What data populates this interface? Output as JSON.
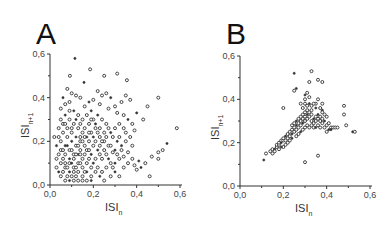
{
  "chart_data": [
    {
      "panel": "A",
      "type": "scatter",
      "title": "A",
      "xlabel": "ISI",
      "xlabel_sub": "n",
      "ylabel": "ISI",
      "ylabel_sub": "n+1",
      "xlim": [
        0,
        0.6
      ],
      "ylim": [
        0,
        0.6
      ],
      "xticks": [
        "0,0",
        "0,2",
        "0,4",
        "0,6"
      ],
      "yticks": [
        "0,0",
        "0,2",
        "0,4",
        "0,6"
      ],
      "grid": false,
      "points": [
        [
          0.115,
          0.58
        ],
        [
          0.185,
          0.53
        ],
        [
          0.25,
          0.5
        ],
        [
          0.31,
          0.51
        ],
        [
          0.355,
          0.48
        ],
        [
          0.157,
          0.47
        ],
        [
          0.092,
          0.5
        ],
        [
          0.5,
          0.4
        ],
        [
          0.45,
          0.36
        ],
        [
          0.585,
          0.26
        ],
        [
          0.54,
          0.19
        ],
        [
          0.52,
          0.16
        ],
        [
          0.5,
          0.15
        ],
        [
          0.47,
          0.13
        ],
        [
          0.44,
          0.1
        ],
        [
          0.42,
          0.08
        ],
        [
          0.4,
          0.07
        ],
        [
          0.46,
          0.04
        ],
        [
          0.5,
          0.12
        ],
        [
          0.43,
          0.3
        ],
        [
          0.4,
          0.33
        ],
        [
          0.37,
          0.39
        ],
        [
          0.35,
          0.41
        ],
        [
          0.33,
          0.38
        ],
        [
          0.3,
          0.36
        ],
        [
          0.28,
          0.4
        ],
        [
          0.26,
          0.42
        ],
        [
          0.24,
          0.41
        ],
        [
          0.22,
          0.43
        ],
        [
          0.2,
          0.39
        ],
        [
          0.18,
          0.38
        ],
        [
          0.14,
          0.4
        ],
        [
          0.12,
          0.41
        ],
        [
          0.1,
          0.42
        ],
        [
          0.08,
          0.44
        ],
        [
          0.06,
          0.4
        ],
        [
          0.05,
          0.35
        ],
        [
          0.07,
          0.37
        ],
        [
          0.09,
          0.38
        ],
        [
          0.16,
          0.36
        ],
        [
          0.19,
          0.34
        ],
        [
          0.23,
          0.37
        ],
        [
          0.27,
          0.35
        ],
        [
          0.31,
          0.33
        ],
        [
          0.34,
          0.32
        ],
        [
          0.36,
          0.3
        ],
        [
          0.38,
          0.28
        ],
        [
          0.39,
          0.25
        ],
        [
          0.37,
          0.22
        ],
        [
          0.35,
          0.2
        ],
        [
          0.33,
          0.18
        ],
        [
          0.38,
          0.18
        ],
        [
          0.36,
          0.15
        ],
        [
          0.34,
          0.13
        ],
        [
          0.32,
          0.12
        ],
        [
          0.3,
          0.1
        ],
        [
          0.38,
          0.12
        ],
        [
          0.36,
          0.1
        ],
        [
          0.34,
          0.08
        ],
        [
          0.39,
          0.09
        ],
        [
          0.41,
          0.11
        ],
        [
          0.29,
          0.15
        ],
        [
          0.27,
          0.18
        ],
        [
          0.25,
          0.2
        ],
        [
          0.23,
          0.22
        ],
        [
          0.28,
          0.24
        ],
        [
          0.3,
          0.26
        ],
        [
          0.32,
          0.28
        ],
        [
          0.26,
          0.28
        ],
        [
          0.24,
          0.3
        ],
        [
          0.22,
          0.32
        ],
        [
          0.2,
          0.3
        ],
        [
          0.18,
          0.28
        ],
        [
          0.21,
          0.26
        ],
        [
          0.19,
          0.24
        ],
        [
          0.17,
          0.22
        ],
        [
          0.15,
          0.24
        ],
        [
          0.13,
          0.26
        ],
        [
          0.11,
          0.28
        ],
        [
          0.09,
          0.3
        ],
        [
          0.07,
          0.32
        ],
        [
          0.05,
          0.3
        ],
        [
          0.04,
          0.26
        ],
        [
          0.06,
          0.24
        ],
        [
          0.08,
          0.22
        ],
        [
          0.1,
          0.2
        ],
        [
          0.12,
          0.18
        ],
        [
          0.14,
          0.16
        ],
        [
          0.16,
          0.14
        ],
        [
          0.18,
          0.12
        ],
        [
          0.2,
          0.1
        ],
        [
          0.22,
          0.08
        ],
        [
          0.24,
          0.06
        ],
        [
          0.26,
          0.08
        ],
        [
          0.28,
          0.1
        ],
        [
          0.3,
          0.06
        ],
        [
          0.32,
          0.04
        ],
        [
          0.28,
          0.04
        ],
        [
          0.24,
          0.12
        ],
        [
          0.26,
          0.14
        ],
        [
          0.22,
          0.16
        ],
        [
          0.2,
          0.18
        ],
        [
          0.18,
          0.2
        ],
        [
          0.16,
          0.18
        ],
        [
          0.14,
          0.2
        ],
        [
          0.12,
          0.22
        ],
        [
          0.1,
          0.24
        ],
        [
          0.08,
          0.26
        ],
        [
          0.06,
          0.28
        ],
        [
          0.04,
          0.22
        ],
        [
          0.03,
          0.18
        ],
        [
          0.04,
          0.14
        ],
        [
          0.05,
          0.1
        ],
        [
          0.06,
          0.06
        ],
        [
          0.07,
          0.02
        ],
        [
          0.09,
          0.02
        ],
        [
          0.11,
          0.02
        ],
        [
          0.13,
          0.02
        ],
        [
          0.15,
          0.02
        ],
        [
          0.17,
          0.02
        ],
        [
          0.19,
          0.02
        ],
        [
          0.05,
          0.04
        ],
        [
          0.07,
          0.08
        ],
        [
          0.09,
          0.1
        ],
        [
          0.11,
          0.12
        ],
        [
          0.13,
          0.14
        ],
        [
          0.15,
          0.12
        ],
        [
          0.17,
          0.1
        ],
        [
          0.19,
          0.08
        ],
        [
          0.21,
          0.06
        ],
        [
          0.23,
          0.04
        ],
        [
          0.25,
          0.02
        ],
        [
          0.03,
          0.08
        ],
        [
          0.03,
          0.12
        ],
        [
          0.05,
          0.16
        ],
        [
          0.07,
          0.18
        ],
        [
          0.09,
          0.16
        ],
        [
          0.11,
          0.14
        ],
        [
          0.13,
          0.1
        ],
        [
          0.15,
          0.08
        ],
        [
          0.17,
          0.06
        ],
        [
          0.19,
          0.04
        ],
        [
          0.21,
          0.12
        ],
        [
          0.23,
          0.14
        ],
        [
          0.25,
          0.16
        ],
        [
          0.27,
          0.12
        ],
        [
          0.29,
          0.08
        ],
        [
          0.31,
          0.14
        ],
        [
          0.33,
          0.16
        ],
        [
          0.35,
          0.24
        ],
        [
          0.31,
          0.2
        ],
        [
          0.29,
          0.22
        ],
        [
          0.27,
          0.26
        ],
        [
          0.25,
          0.24
        ],
        [
          0.23,
          0.26
        ],
        [
          0.21,
          0.28
        ],
        [
          0.19,
          0.3
        ],
        [
          0.17,
          0.32
        ],
        [
          0.15,
          0.3
        ],
        [
          0.13,
          0.32
        ],
        [
          0.11,
          0.34
        ],
        [
          0.09,
          0.34
        ],
        [
          0.07,
          0.28
        ],
        [
          0.05,
          0.2
        ],
        [
          0.07,
          0.14
        ],
        [
          0.09,
          0.06
        ],
        [
          0.11,
          0.06
        ],
        [
          0.13,
          0.06
        ],
        [
          0.15,
          0.04
        ],
        [
          0.11,
          0.08
        ],
        [
          0.09,
          0.12
        ],
        [
          0.07,
          0.1
        ],
        [
          0.13,
          0.18
        ],
        [
          0.15,
          0.2
        ],
        [
          0.17,
          0.16
        ],
        [
          0.19,
          0.14
        ],
        [
          0.21,
          0.2
        ],
        [
          0.23,
          0.18
        ],
        [
          0.1,
          0.16
        ],
        [
          0.12,
          0.14
        ],
        [
          0.08,
          0.18
        ],
        [
          0.06,
          0.12
        ],
        [
          0.14,
          0.1
        ],
        [
          0.16,
          0.06
        ],
        [
          0.18,
          0.16
        ],
        [
          0.2,
          0.22
        ],
        [
          0.22,
          0.24
        ],
        [
          0.24,
          0.2
        ],
        [
          0.26,
          0.22
        ],
        [
          0.28,
          0.18
        ],
        [
          0.3,
          0.16
        ],
        [
          0.32,
          0.22
        ],
        [
          0.34,
          0.26
        ],
        [
          0.02,
          0.22
        ],
        [
          0.1,
          0.26
        ],
        [
          0.12,
          0.3
        ],
        [
          0.14,
          0.28
        ],
        [
          0.16,
          0.26
        ],
        [
          0.18,
          0.24
        ],
        [
          0.08,
          0.04
        ],
        [
          0.1,
          0.1
        ],
        [
          0.12,
          0.04
        ],
        [
          0.14,
          0.22
        ],
        [
          0.16,
          0.22
        ],
        [
          0.06,
          0.16
        ],
        [
          0.04,
          0.06
        ],
        [
          0.08,
          0.08
        ],
        [
          0.1,
          0.04
        ],
        [
          0.14,
          0.14
        ],
        [
          0.12,
          0.08
        ]
      ]
    },
    {
      "panel": "B",
      "type": "scatter",
      "title": "B",
      "xlabel": "ISI",
      "xlabel_sub": "n",
      "ylabel": "ISI",
      "ylabel_sub": "n+1",
      "xlim": [
        0,
        0.6
      ],
      "ylim": [
        0,
        0.6
      ],
      "xticks": [
        "0,0",
        "0,2",
        "0,4",
        "0,6"
      ],
      "yticks": [
        "0,0",
        "0,2",
        "0,4",
        "0,6"
      ],
      "grid": false,
      "points": [
        [
          0.25,
          0.52
        ],
        [
          0.33,
          0.53
        ],
        [
          0.36,
          0.49
        ],
        [
          0.38,
          0.48
        ],
        [
          0.32,
          0.48
        ],
        [
          0.26,
          0.45
        ],
        [
          0.25,
          0.44
        ],
        [
          0.2,
          0.36
        ],
        [
          0.48,
          0.37
        ],
        [
          0.48,
          0.33
        ],
        [
          0.52,
          0.25
        ],
        [
          0.53,
          0.25
        ],
        [
          0.49,
          0.28
        ],
        [
          0.36,
          0.14
        ],
        [
          0.3,
          0.11
        ],
        [
          0.11,
          0.12
        ],
        [
          0.12,
          0.15
        ],
        [
          0.14,
          0.16
        ],
        [
          0.15,
          0.15
        ],
        [
          0.15,
          0.17
        ],
        [
          0.16,
          0.17
        ],
        [
          0.17,
          0.18
        ],
        [
          0.17,
          0.19
        ],
        [
          0.18,
          0.19
        ],
        [
          0.18,
          0.2
        ],
        [
          0.19,
          0.2
        ],
        [
          0.19,
          0.21
        ],
        [
          0.2,
          0.21
        ],
        [
          0.2,
          0.22
        ],
        [
          0.21,
          0.21
        ],
        [
          0.21,
          0.23
        ],
        [
          0.22,
          0.22
        ],
        [
          0.22,
          0.24
        ],
        [
          0.23,
          0.23
        ],
        [
          0.23,
          0.25
        ],
        [
          0.24,
          0.24
        ],
        [
          0.24,
          0.26
        ],
        [
          0.25,
          0.25
        ],
        [
          0.25,
          0.27
        ],
        [
          0.26,
          0.26
        ],
        [
          0.26,
          0.28
        ],
        [
          0.27,
          0.27
        ],
        [
          0.27,
          0.29
        ],
        [
          0.28,
          0.28
        ],
        [
          0.28,
          0.3
        ],
        [
          0.29,
          0.29
        ],
        [
          0.29,
          0.31
        ],
        [
          0.3,
          0.3
        ],
        [
          0.3,
          0.32
        ],
        [
          0.31,
          0.31
        ],
        [
          0.31,
          0.33
        ],
        [
          0.32,
          0.32
        ],
        [
          0.32,
          0.34
        ],
        [
          0.33,
          0.33
        ],
        [
          0.33,
          0.3
        ],
        [
          0.34,
          0.31
        ],
        [
          0.34,
          0.29
        ],
        [
          0.35,
          0.3
        ],
        [
          0.35,
          0.32
        ],
        [
          0.36,
          0.31
        ],
        [
          0.36,
          0.33
        ],
        [
          0.37,
          0.32
        ],
        [
          0.37,
          0.3
        ],
        [
          0.38,
          0.31
        ],
        [
          0.38,
          0.29
        ],
        [
          0.39,
          0.3
        ],
        [
          0.4,
          0.32
        ],
        [
          0.4,
          0.28
        ],
        [
          0.41,
          0.29
        ],
        [
          0.42,
          0.27
        ],
        [
          0.42,
          0.26
        ],
        [
          0.43,
          0.27
        ],
        [
          0.44,
          0.27
        ],
        [
          0.45,
          0.27
        ],
        [
          0.39,
          0.33
        ],
        [
          0.38,
          0.35
        ],
        [
          0.38,
          0.38
        ],
        [
          0.36,
          0.4
        ],
        [
          0.35,
          0.38
        ],
        [
          0.34,
          0.38
        ],
        [
          0.32,
          0.38
        ],
        [
          0.3,
          0.38
        ],
        [
          0.28,
          0.38
        ],
        [
          0.3,
          0.4
        ],
        [
          0.32,
          0.41
        ],
        [
          0.3,
          0.42
        ],
        [
          0.31,
          0.43
        ],
        [
          0.29,
          0.36
        ],
        [
          0.31,
          0.35
        ],
        [
          0.33,
          0.35
        ],
        [
          0.35,
          0.36
        ],
        [
          0.34,
          0.27
        ],
        [
          0.32,
          0.27
        ],
        [
          0.3,
          0.27
        ],
        [
          0.29,
          0.26
        ],
        [
          0.28,
          0.25
        ],
        [
          0.27,
          0.24
        ],
        [
          0.26,
          0.23
        ],
        [
          0.31,
          0.28
        ],
        [
          0.33,
          0.28
        ],
        [
          0.35,
          0.27
        ],
        [
          0.36,
          0.28
        ],
        [
          0.37,
          0.27
        ],
        [
          0.39,
          0.27
        ],
        [
          0.4,
          0.25
        ],
        [
          0.41,
          0.26
        ],
        [
          0.38,
          0.34
        ],
        [
          0.37,
          0.36
        ],
        [
          0.33,
          0.37
        ],
        [
          0.27,
          0.31
        ],
        [
          0.26,
          0.3
        ],
        [
          0.28,
          0.32
        ],
        [
          0.29,
          0.33
        ],
        [
          0.3,
          0.34
        ],
        [
          0.31,
          0.37
        ],
        [
          0.24,
          0.22
        ],
        [
          0.23,
          0.21
        ],
        [
          0.22,
          0.2
        ],
        [
          0.21,
          0.19
        ],
        [
          0.2,
          0.18
        ],
        [
          0.19,
          0.18
        ],
        [
          0.18,
          0.17
        ],
        [
          0.16,
          0.16
        ],
        [
          0.24,
          0.28
        ],
        [
          0.25,
          0.29
        ]
      ]
    }
  ]
}
